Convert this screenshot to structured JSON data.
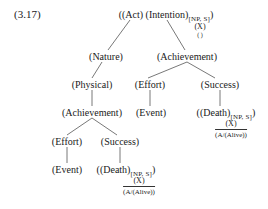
{
  "example_number": "(3.17)",
  "root": {
    "open": "((",
    "act": "Act",
    "intention": "(Intention)",
    "subscript": "[NP, S]",
    "close": ")",
    "x_label": "(X)",
    "empty": "( )"
  },
  "nodes": {
    "nature": "(Nature)",
    "achievement_top": "(Achievement)",
    "physical": "(Physical)",
    "effort_right": "(Effort)",
    "success_right": "(Success)",
    "achievement_left": "(Achievement)",
    "event_right": "(Event)",
    "death_right": "((Death)",
    "death_right_sub": "[NP, S]",
    "death_right_close": ")",
    "death_right_x": "(X)",
    "death_right_over": "(A/(Alive))",
    "effort_left": "(Effort)",
    "success_left": "(Success)",
    "event_left": "(Event)",
    "death_left": "((Death)",
    "death_left_sub": "[NP, S]",
    "death_left_close": ")",
    "death_left_x": "(X)",
    "death_left_over": "(A/(Alive))"
  }
}
